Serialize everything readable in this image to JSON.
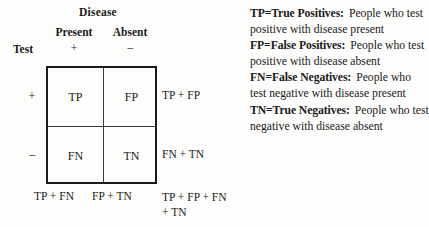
{
  "matrix": {
    "column_group_header": "Disease",
    "row_group_header": "Test",
    "column_headers": [
      {
        "label": "Present",
        "sign": "+"
      },
      {
        "label": "Absent",
        "sign": "−"
      }
    ],
    "row_headers": [
      {
        "sign": "+"
      },
      {
        "sign": "−"
      }
    ],
    "cells": [
      [
        "TP",
        "FP"
      ],
      [
        "FN",
        "TN"
      ]
    ],
    "row_totals": [
      "TP + FP",
      "FN + TN"
    ],
    "column_totals": [
      "TP + FN",
      "FP + TN"
    ],
    "grand_total": "TP + FP + FN + TN"
  },
  "legend": {
    "items": [
      {
        "term": "TP=True Positives:",
        "description": "People who test positive with disease present"
      },
      {
        "term": "FP=False Positives:",
        "description": "People who test positive with disease absent"
      },
      {
        "term": "FN=False Negatives:",
        "description": "People who test negative with disease present"
      },
      {
        "term": "TN=True Negatives:",
        "description": "People who test negative with disease absent"
      }
    ]
  },
  "colors": {
    "ink": "#1a1a1a",
    "rule": "#3a3a3a",
    "background": "#fdfdfb"
  }
}
